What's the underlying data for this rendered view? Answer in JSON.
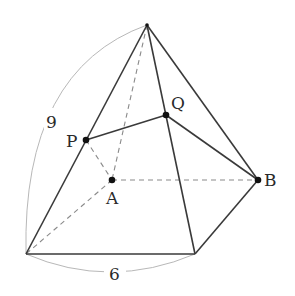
{
  "diagram": {
    "title": "",
    "points": {
      "O": {
        "x": 147,
        "y": 25,
        "label": ""
      },
      "P": {
        "x": 86,
        "y": 140,
        "label": "P"
      },
      "Q": {
        "x": 166,
        "y": 115,
        "label": "Q"
      },
      "A": {
        "x": 112,
        "y": 180,
        "label": "A"
      },
      "B": {
        "x": 258,
        "y": 180,
        "label": "B"
      },
      "C": {
        "x": 26,
        "y": 254,
        "label": ""
      },
      "D": {
        "x": 195,
        "y": 254,
        "label": ""
      }
    },
    "labels": {
      "P": "P",
      "Q": "Q",
      "A": "A",
      "B": "B",
      "edge_length_slant": "9",
      "edge_length_base": "6"
    },
    "solid_edges": [
      [
        "O",
        "C"
      ],
      [
        "O",
        "D"
      ],
      [
        "O",
        "B"
      ],
      [
        "C",
        "D"
      ],
      [
        "D",
        "B"
      ],
      [
        "P",
        "Q"
      ],
      [
        "Q",
        "B"
      ]
    ],
    "dashed_edges": [
      [
        "O",
        "A"
      ],
      [
        "A",
        "C"
      ],
      [
        "A",
        "B"
      ],
      [
        "P",
        "A"
      ]
    ],
    "dimension_arcs": [
      {
        "from": "C",
        "to": "O",
        "value": "9"
      },
      {
        "from": "C",
        "to": "D",
        "value": "6"
      }
    ],
    "colors": {
      "solid_edge": "#3a3a3a",
      "hidden_edge": "#8a8a8a",
      "dimension_arc": "#b8b8b8",
      "point": "#111111",
      "background": "#ffffff"
    }
  }
}
